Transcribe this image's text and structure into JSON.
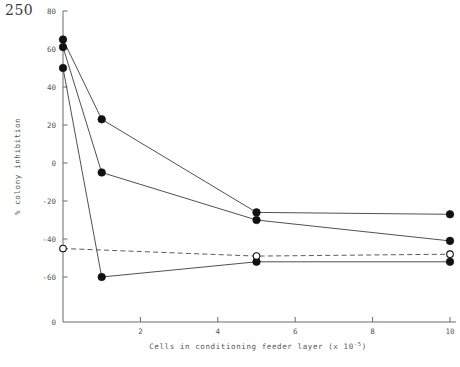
{
  "page": {
    "number": "250"
  },
  "chart_data": {
    "type": "line",
    "title": "",
    "xlabel": "Cells in conditioning feeder layer (x 10",
    "xlabel_exponent": "-5",
    "xlabel_suffix": ")",
    "ylabel": "% colony inhibition",
    "xlim": [
      0,
      10.3
    ],
    "ylim": [
      -72,
      80
    ],
    "xticks": [
      2,
      4,
      6,
      8,
      10
    ],
    "xtick_labels": [
      "2",
      "4",
      "6",
      "8",
      "10"
    ],
    "yticks": [
      80,
      60,
      40,
      20,
      0,
      -20,
      -40,
      -60
    ],
    "ytick_labels": [
      "80",
      "60",
      "40",
      "20",
      "0",
      "-20",
      "-40",
      "-60"
    ],
    "origin_label": "0",
    "grid": false,
    "legend": "none",
    "series": [
      {
        "name": "series-1",
        "marker": "filled-circle",
        "linestyle": "solid",
        "x": [
          0,
          1,
          5,
          10
        ],
        "y": [
          65,
          23,
          -26,
          -27
        ]
      },
      {
        "name": "series-2",
        "marker": "filled-circle",
        "linestyle": "solid",
        "x": [
          0,
          1,
          5,
          10
        ],
        "y": [
          61,
          -5,
          -30,
          -41
        ]
      },
      {
        "name": "series-3",
        "marker": "filled-circle",
        "linestyle": "solid",
        "x": [
          0,
          1,
          5,
          10
        ],
        "y": [
          50,
          -60,
          -52,
          -52
        ]
      },
      {
        "name": "series-4",
        "marker": "open-circle",
        "linestyle": "dashed",
        "x": [
          0,
          5,
          10
        ],
        "y": [
          -45,
          -49,
          -48
        ]
      }
    ]
  }
}
